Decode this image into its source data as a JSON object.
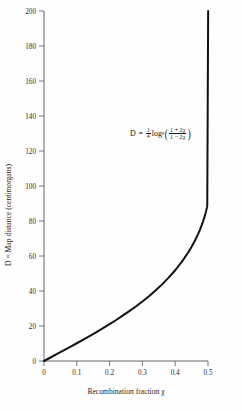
{
  "figure": {
    "background_color": "#fefefe",
    "curve_color": "#111111",
    "axis_color": "#555555"
  },
  "annotation": {
    "name": "kosambi-equation",
    "lhs": "D",
    "equals": "=",
    "coefficient_numerator": "1",
    "coefficient_denominator": "4",
    "log_base_text": "log",
    "log_subscript": "e",
    "paren_open": "(",
    "paren_close": ")",
    "fraction_numerator": "1 + 2χ",
    "fraction_denominator": "1 − 2χ",
    "plain_text": "D = 1/4 log_e((1 + 2χ)/(1 − 2χ))"
  },
  "chart_data": {
    "type": "line",
    "title": "",
    "xlabel": "Recombination fraction χ",
    "ylabel": "D = Map distance (centimorgans)",
    "xlim": [
      0,
      0.5
    ],
    "ylim": [
      0,
      200
    ],
    "grid": false,
    "legend": "none",
    "xticks": [
      0,
      0.1,
      0.2,
      0.3,
      0.4,
      0.5
    ],
    "xtick_labels": [
      "0",
      "0.1",
      "0.2",
      "0.3",
      "0.4",
      "0.5"
    ],
    "yticks": [
      0,
      20,
      40,
      60,
      80,
      100,
      120,
      140,
      160,
      180,
      200
    ],
    "ytick_labels": [
      "0",
      "20",
      "40",
      "60",
      "80",
      "100",
      "120",
      "140",
      "160",
      "180",
      "200"
    ],
    "series": [
      {
        "name": "Kosambi mapping function",
        "equation": "D = 25 * ln((1 + 2x)/(1 - 2x))",
        "x": [
          0,
          0.02,
          0.04,
          0.06,
          0.08,
          0.1,
          0.12,
          0.14,
          0.16,
          0.18,
          0.2,
          0.22,
          0.24,
          0.26,
          0.28,
          0.3,
          0.32,
          0.34,
          0.36,
          0.38,
          0.4,
          0.42,
          0.44,
          0.45,
          0.46,
          0.47,
          0.475,
          0.48,
          0.485,
          0.49,
          0.4925,
          0.494,
          0.4955,
          0.4965,
          0.4972,
          0.49775
        ],
        "y": [
          0,
          2.0,
          4.01,
          6.04,
          8.08,
          10.14,
          12.24,
          14.37,
          16.55,
          18.77,
          21.07,
          23.44,
          25.9,
          28.47,
          31.16,
          34.01,
          37.04,
          40.28,
          43.79,
          47.62,
          51.86,
          56.63,
          62.12,
          65.23,
          68.69,
          72.61,
          74.8,
          77.19,
          79.82,
          82.76,
          84.4,
          85.48,
          86.7,
          87.6,
          88.32,
          89.0
        ]
      }
    ]
  },
  "axes_geometry": {
    "plot_left_px": 44,
    "plot_right_px": 208,
    "plot_top_px": 11,
    "plot_bottom_px": 361
  }
}
